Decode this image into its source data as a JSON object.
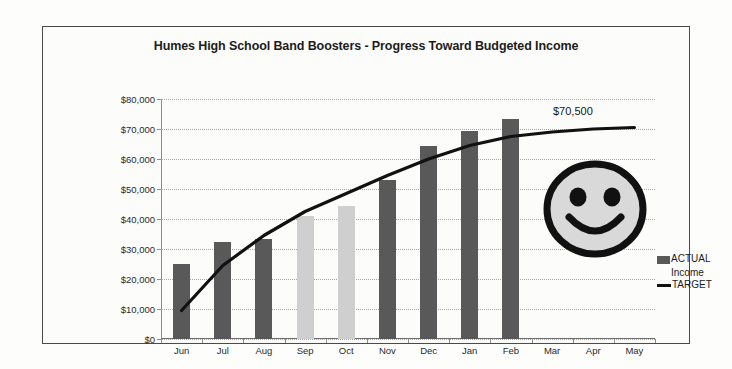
{
  "chart_data": {
    "type": "bar",
    "title": "Humes High School Band Boosters - Progress Toward Budgeted Income",
    "xlabel": "",
    "ylabel": "",
    "ylim": [
      0,
      80000
    ],
    "ytick_step": 10000,
    "grid": true,
    "legend_position": "right",
    "categories": [
      "Jun",
      "Jul",
      "Aug",
      "Sep",
      "Oct",
      "Nov",
      "Dec",
      "Jan",
      "Feb",
      "Mar",
      "Apr",
      "May"
    ],
    "series": [
      {
        "name": "ACTUAL Income",
        "type": "bar",
        "color": "#595959",
        "highlight_color": "#cfcfcf",
        "highlight_categories": [
          "Sep",
          "Oct"
        ],
        "values": [
          25000,
          32500,
          33500,
          41000,
          44500,
          53000,
          64500,
          69500,
          73500,
          null,
          null,
          null
        ]
      },
      {
        "name": "TARGET",
        "type": "line",
        "color": "#111111",
        "values": [
          9500,
          24500,
          34500,
          42500,
          48500,
          54500,
          60000,
          64500,
          67500,
          69000,
          70000,
          70500
        ]
      }
    ],
    "ytick_labels": [
      "$80,000",
      "$70,000",
      "$60,000",
      "$50,000",
      "$40,000",
      "$30,000",
      "$20,000",
      "$10,000",
      "$0"
    ],
    "ytick_values": [
      80000,
      70000,
      60000,
      50000,
      40000,
      30000,
      20000,
      10000,
      0
    ],
    "annotations": [
      {
        "name": "target-end-value",
        "text": "$70,500",
        "value": 70500,
        "category": "May"
      },
      {
        "name": "smiley-face",
        "text": "smiley-face-icon"
      }
    ]
  },
  "legend": {
    "actual_label_line1": "ACTUAL",
    "actual_label_line2": "Income",
    "target_label": "TARGET"
  },
  "colors": {
    "bar_dark": "#595959",
    "bar_light": "#cfcfcf",
    "target_line": "#111111",
    "smiley_fill": "#d9d9d9",
    "smiley_outline": "#111111",
    "frame": "#4a4a4a"
  }
}
